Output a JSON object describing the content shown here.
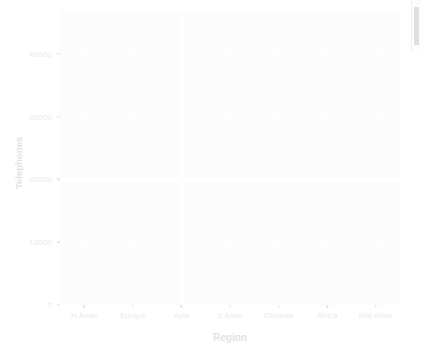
{
  "chart_data": {
    "type": "bar",
    "title": "",
    "subtitle": "",
    "xlabel": "Region",
    "ylabel": "Telephones",
    "categories": [
      "N.Amer",
      "Europe",
      "Asia",
      "S.Amer",
      "Oceania",
      "Africa",
      "Mid.Amer"
    ],
    "values": [
      null,
      null,
      null,
      null,
      null,
      null,
      null
    ],
    "series": [
      {
        "name": "Telephones",
        "values": [
          null,
          null,
          null,
          null,
          null,
          null,
          null
        ]
      }
    ],
    "ylim": [
      0,
      47000
    ],
    "y_ticks": [
      0,
      10000,
      20000,
      30000,
      40000
    ],
    "y_tick_labels": [
      "0",
      "10000",
      "20000",
      "30000",
      "40000"
    ],
    "y_minor_ticks": [
      5000,
      15000,
      25000,
      35000,
      45000
    ],
    "grid": true,
    "grid_color": "#ffffff",
    "panel_background": "#ebebeb",
    "legend": "none",
    "legend_position": "none",
    "annotations": [],
    "note": "Plot panel is rendered empty - no data geometry is visible; entire figure appears heavily faded."
  },
  "axes": {
    "y": {
      "title": "Telephones",
      "ticks": [
        {
          "label": "40000",
          "value": 40000
        },
        {
          "label": "30000",
          "value": 30000
        },
        {
          "label": "20000",
          "value": 20000
        },
        {
          "label": "10000",
          "value": 10000
        },
        {
          "label": "0",
          "value": 0
        }
      ]
    },
    "x": {
      "title": "Region",
      "ticks": [
        {
          "label": "N.Amer"
        },
        {
          "label": "Europe"
        },
        {
          "label": "Asia"
        },
        {
          "label": "S.Amer"
        },
        {
          "label": "Oceania"
        },
        {
          "label": "Africa"
        },
        {
          "label": "Mid.Amer"
        }
      ]
    }
  },
  "colors": {
    "panel": "#ebebeb",
    "gridline": "#ffffff",
    "tick_text": "#4d4d4d",
    "axis_title": "#1a1a1a",
    "background": "#ffffff",
    "scrollbar_thumb": "#c8c8c8"
  },
  "scrollbar": {
    "name": "vertical-scrollbar",
    "thumb_visible": true
  }
}
